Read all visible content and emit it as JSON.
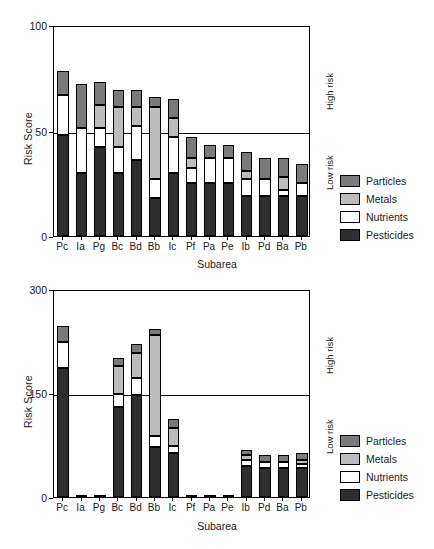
{
  "chart_data": [
    {
      "id": "top",
      "type": "bar",
      "stacked": true,
      "title": "",
      "xlabel": "Subarea",
      "ylabel": "Risk Score",
      "ylim": [
        0,
        100
      ],
      "yticks": [
        0,
        50,
        100
      ],
      "grid": false,
      "threshold": 50,
      "threshold_labels": {
        "above": "High risk",
        "below": "Low risk"
      },
      "legend_position": "right",
      "categories": [
        "Pc",
        "Ia",
        "Pg",
        "Bc",
        "Bd",
        "Bb",
        "Ic",
        "Pf",
        "Pa",
        "Pe",
        "Ib",
        "Pd",
        "Ba",
        "Pb"
      ],
      "series": [
        {
          "name": "Pesticides",
          "color": "#2e2e2e",
          "values": [
            48,
            30,
            42,
            30,
            36,
            18,
            30,
            25,
            25,
            25,
            19,
            19,
            19,
            19
          ]
        },
        {
          "name": "Nutrients",
          "color": "#ffffff",
          "values": [
            19,
            21,
            9,
            12,
            16,
            9,
            17,
            7,
            12,
            12,
            8,
            8,
            3,
            6
          ]
        },
        {
          "name": "Metals",
          "color": "#bcbcbc",
          "values": [
            0,
            0,
            11,
            19,
            9,
            34,
            9,
            5,
            0,
            0,
            4,
            0,
            6,
            0
          ]
        },
        {
          "name": "Particles",
          "color": "#7a7a7a",
          "values": [
            11,
            21,
            11,
            8,
            8,
            5,
            9,
            10,
            6,
            6,
            9,
            10,
            9,
            9
          ]
        }
      ]
    },
    {
      "id": "bottom",
      "type": "bar",
      "stacked": true,
      "title": "",
      "xlabel": "Subarea",
      "ylabel": "Risk Score",
      "ylim": [
        0,
        300
      ],
      "yticks": [
        0,
        150,
        300
      ],
      "grid": false,
      "threshold": 150,
      "threshold_labels": {
        "above": "High risk",
        "below": "Low risk"
      },
      "legend_position": "right",
      "categories": [
        "Pc",
        "Ia",
        "Pg",
        "Bc",
        "Bd",
        "Bb",
        "Ic",
        "Pf",
        "Pa",
        "Pe",
        "Ib",
        "Pd",
        "Ba",
        "Pb"
      ],
      "series": [
        {
          "name": "Pesticides",
          "color": "#2e2e2e",
          "values": [
            186,
            3,
            3,
            130,
            147,
            72,
            64,
            3,
            3,
            3,
            45,
            42,
            42,
            42
          ]
        },
        {
          "name": "Nutrients",
          "color": "#ffffff",
          "values": [
            38,
            0,
            0,
            19,
            24,
            16,
            9,
            0,
            0,
            0,
            9,
            8,
            8,
            6
          ]
        },
        {
          "name": "Metals",
          "color": "#bcbcbc",
          "values": [
            0,
            0,
            0,
            40,
            37,
            146,
            27,
            0,
            0,
            0,
            6,
            0,
            0,
            6
          ]
        },
        {
          "name": "Particles",
          "color": "#7a7a7a",
          "values": [
            23,
            0,
            0,
            11,
            13,
            9,
            13,
            0,
            0,
            0,
            8,
            10,
            10,
            10
          ]
        }
      ]
    }
  ],
  "legend": {
    "items": [
      {
        "label": "Particles",
        "color": "#7a7a7a"
      },
      {
        "label": "Metals",
        "color": "#bcbcbc"
      },
      {
        "label": "Nutrients",
        "color": "#ffffff"
      },
      {
        "label": "Pesticides",
        "color": "#2e2e2e"
      }
    ]
  }
}
